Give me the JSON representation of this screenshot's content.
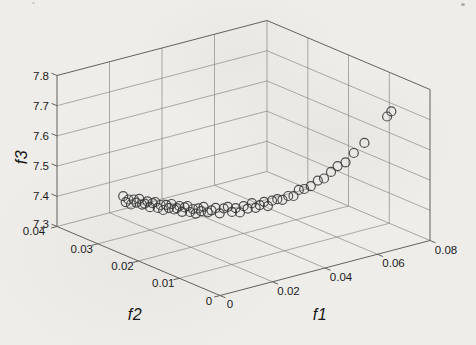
{
  "figure": {
    "kind": "matlab-style 3d scatter figure on scanned page",
    "title": ""
  },
  "colors": {
    "background": "#eeede9",
    "grid_line": "#85827c",
    "box_edge": "#55534f",
    "marker_outline": "#383838",
    "label_text": "#1b1b1b"
  },
  "chart_data": {
    "type": "scatter",
    "projection": "3d",
    "title": "",
    "xlabel": "f1",
    "ylabel": "f2",
    "zlabel": "f3",
    "xlim": [
      0,
      0.08
    ],
    "ylim": [
      0,
      0.04
    ],
    "zlim": [
      7.3,
      7.8
    ],
    "x_tick_values": [
      0,
      0.02,
      0.04,
      0.06,
      0.08
    ],
    "x_tick_labels": [
      "0",
      "0.02",
      "0.04",
      "0.06",
      "0.08"
    ],
    "y_tick_values": [
      0,
      0.01,
      0.02,
      0.03,
      0.04
    ],
    "y_tick_labels": [
      "0",
      "0.01",
      "0.02",
      "0.03",
      "0.04"
    ],
    "z_tick_values": [
      7.3,
      7.4,
      7.5,
      7.6,
      7.7,
      7.8
    ],
    "z_tick_labels": [
      "7.3",
      "7.4",
      "7.5",
      "7.6",
      "7.7",
      "7.8"
    ],
    "grid": true,
    "legend": null,
    "marker": "circle-open",
    "points": [
      [
        0.019,
        0.036,
        7.38
      ],
      [
        0.0195,
        0.0357,
        7.361
      ],
      [
        0.0201,
        0.0354,
        7.37
      ],
      [
        0.0206,
        0.0351,
        7.354
      ],
      [
        0.0212,
        0.0348,
        7.371
      ],
      [
        0.0217,
        0.0345,
        7.361
      ],
      [
        0.0222,
        0.0341,
        7.375
      ],
      [
        0.0228,
        0.0338,
        7.356
      ],
      [
        0.0233,
        0.0335,
        7.36
      ],
      [
        0.0239,
        0.0332,
        7.368
      ],
      [
        0.0244,
        0.0329,
        7.349
      ],
      [
        0.0249,
        0.0326,
        7.363
      ],
      [
        0.0255,
        0.0323,
        7.367
      ],
      [
        0.026,
        0.032,
        7.348
      ],
      [
        0.0266,
        0.0317,
        7.358
      ],
      [
        0.0271,
        0.0314,
        7.342
      ],
      [
        0.0276,
        0.031,
        7.36
      ],
      [
        0.0282,
        0.0307,
        7.35
      ],
      [
        0.0287,
        0.0304,
        7.364
      ],
      [
        0.0293,
        0.0301,
        7.346
      ],
      [
        0.0298,
        0.0298,
        7.351
      ],
      [
        0.0303,
        0.0295,
        7.359
      ],
      [
        0.0309,
        0.0292,
        7.34
      ],
      [
        0.0314,
        0.0289,
        7.355
      ],
      [
        0.032,
        0.0286,
        7.36
      ],
      [
        0.0325,
        0.0283,
        7.341
      ],
      [
        0.033,
        0.0279,
        7.352
      ],
      [
        0.0336,
        0.0276,
        7.337
      ],
      [
        0.0341,
        0.0273,
        7.355
      ],
      [
        0.0347,
        0.027,
        7.346
      ],
      [
        0.0352,
        0.0267,
        7.361
      ],
      [
        0.036,
        0.0262,
        7.344
      ],
      [
        0.0368,
        0.0258,
        7.351
      ],
      [
        0.0376,
        0.0253,
        7.36
      ],
      [
        0.0384,
        0.0248,
        7.343
      ],
      [
        0.0393,
        0.0244,
        7.36
      ],
      [
        0.0401,
        0.0239,
        7.366
      ],
      [
        0.0409,
        0.0234,
        7.35
      ],
      [
        0.0417,
        0.023,
        7.363
      ],
      [
        0.0425,
        0.0225,
        7.35
      ],
      [
        0.0433,
        0.0221,
        7.371
      ],
      [
        0.0441,
        0.0216,
        7.364
      ],
      [
        0.0449,
        0.0211,
        7.383
      ],
      [
        0.0457,
        0.0207,
        7.368
      ],
      [
        0.0465,
        0.0202,
        7.378
      ],
      [
        0.0474,
        0.0197,
        7.39
      ],
      [
        0.0482,
        0.0193,
        7.376
      ],
      [
        0.049,
        0.0188,
        7.395
      ],
      [
        0.0501,
        0.0182,
        7.401
      ],
      [
        0.0511,
        0.0176,
        7.4
      ],
      [
        0.0522,
        0.0169,
        7.414
      ],
      [
        0.0533,
        0.0163,
        7.415
      ],
      [
        0.0544,
        0.0157,
        7.436
      ],
      [
        0.0555,
        0.0151,
        7.44
      ],
      [
        0.0568,
        0.0143,
        7.451
      ],
      [
        0.0582,
        0.0135,
        7.471
      ],
      [
        0.0595,
        0.0128,
        7.479
      ],
      [
        0.0609,
        0.012,
        7.502
      ],
      [
        0.0622,
        0.0112,
        7.523
      ],
      [
        0.0638,
        0.0103,
        7.537
      ],
      [
        0.0654,
        0.0093,
        7.57
      ],
      [
        0.0676,
        0.0081,
        7.605
      ],
      [
        0.0722,
        0.0055,
        7.697
      ],
      [
        0.073,
        0.005,
        7.715
      ]
    ]
  }
}
